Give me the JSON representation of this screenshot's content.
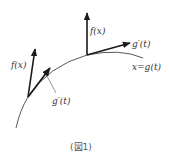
{
  "figure": {
    "caption": "(図1)",
    "colors": {
      "ink": "#1a1a1a",
      "curve": "#444444",
      "text": "#333333"
    },
    "labels": {
      "f_top": "f(x)",
      "g_top": "g′(t)",
      "curve": "x=g(t)",
      "f_left": "f(x)",
      "g_left": "g′(t)"
    },
    "curve": {
      "name": "x=g(t)",
      "points": [
        [
          16,
          128
        ],
        [
          27,
          98
        ],
        [
          47,
          72
        ],
        [
          60,
          63
        ],
        [
          75,
          58
        ],
        [
          87,
          55
        ],
        [
          115,
          53
        ],
        [
          143,
          58
        ]
      ]
    },
    "vectors": [
      {
        "name": "f(x)",
        "from": [
          87,
          55
        ],
        "to": [
          87,
          12
        ]
      },
      {
        "name": "g′(t)",
        "from": [
          87,
          55
        ],
        "to": [
          131,
          43
        ]
      },
      {
        "name": "f(x)",
        "from": [
          28,
          97
        ],
        "to": [
          35,
          48
        ]
      },
      {
        "name": "g′(t)",
        "from": [
          28,
          97
        ],
        "to": [
          51,
          67
        ]
      }
    ]
  }
}
